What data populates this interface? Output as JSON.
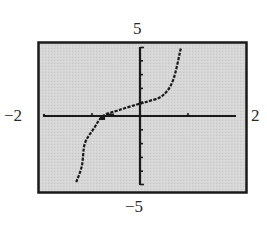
{
  "chart_data": {
    "type": "line",
    "title": "",
    "xlabel": "",
    "ylabel": "",
    "xlim": [
      -2,
      2
    ],
    "ylim": [
      -5,
      5
    ],
    "window_labels": {
      "xmin": "−2",
      "xmax": "2",
      "ymin": "−5",
      "ymax": "5"
    },
    "x_ticks": [
      -1,
      1
    ],
    "y_ticks": [
      -4,
      -3,
      -2,
      -1,
      1,
      2,
      3,
      4
    ],
    "grid": false,
    "legend": null,
    "series": [
      {
        "name": "f(x)",
        "style": "dotted-calculator",
        "points": [
          {
            "x": -1.33,
            "y": -4.8
          },
          {
            "x": -1.21,
            "y": -3.6
          },
          {
            "x": -1.15,
            "y": -2.0
          },
          {
            "x": -0.96,
            "y": -0.9
          },
          {
            "x": -0.77,
            "y": 0.0
          },
          {
            "x": -0.42,
            "y": 0.45
          },
          {
            "x": 0.0,
            "y": 0.9
          },
          {
            "x": 0.21,
            "y": 1.1
          },
          {
            "x": 0.48,
            "y": 1.5
          },
          {
            "x": 0.69,
            "y": 2.6
          },
          {
            "x": 0.85,
            "y": 4.9
          }
        ]
      }
    ],
    "annotations": [
      {
        "type": "marked-point",
        "x": -0.77,
        "y": 0.0,
        "description": "x-intercept"
      }
    ]
  },
  "colors": {
    "screen_background": "#d4d4d4",
    "frame": "#1a1a1a",
    "axes": "#1a1a1a",
    "curve": "#1a1a1a",
    "label_text": "#2a2a2a"
  },
  "layout": {
    "frame": {
      "x": 38,
      "y": 42,
      "w": 209,
      "h": 151
    },
    "plot_area": {
      "x0": 44,
      "x1": 236,
      "y0": 47,
      "y1": 185
    }
  }
}
